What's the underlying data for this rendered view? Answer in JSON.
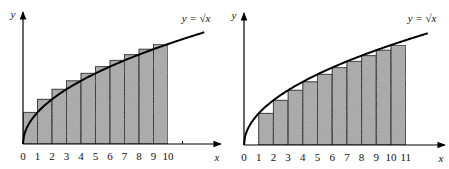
{
  "colors": {
    "bar_fill": "#a9a9a9",
    "bar_stroke": "#111111",
    "curve": "#000000",
    "axis": "#000000"
  },
  "chart_data": [
    {
      "type": "bar",
      "subtype": "riemann-sum-right-endpoint-overestimate",
      "title": "",
      "function_label": "y = √x",
      "xlabel": "x",
      "ylabel": "y",
      "x_ticks": [
        "0",
        "1",
        "2",
        "3",
        "4",
        "5",
        "6",
        "7",
        "8",
        "9",
        "10"
      ],
      "bars": [
        {
          "x0": 0,
          "x1": 1,
          "height": 1.0
        },
        {
          "x0": 1,
          "x1": 2,
          "height": 1.414
        },
        {
          "x0": 2,
          "x1": 3,
          "height": 1.732
        },
        {
          "x0": 3,
          "x1": 4,
          "height": 2.0
        },
        {
          "x0": 4,
          "x1": 5,
          "height": 2.236
        },
        {
          "x0": 5,
          "x1": 6,
          "height": 2.449
        },
        {
          "x0": 6,
          "x1": 7,
          "height": 2.646
        },
        {
          "x0": 7,
          "x1": 8,
          "height": 2.828
        },
        {
          "x0": 8,
          "x1": 9,
          "height": 3.0
        },
        {
          "x0": 9,
          "x1": 10,
          "height": 3.162
        }
      ],
      "curve_x_range": [
        0,
        12.5
      ],
      "xlim": [
        0,
        13.6
      ],
      "ylim": [
        0,
        4.2
      ],
      "grid": false,
      "layout": {
        "origin_px": [
          23,
          144
        ],
        "px_per_x": 14.5,
        "px_per_y": 31.6,
        "x_axis_end_px": 221,
        "y_axis_top_px": 12,
        "label_pos": [
          196,
          22
        ],
        "extra_tick_x": 11
      }
    },
    {
      "type": "bar",
      "subtype": "riemann-sum-left-endpoint-underestimate",
      "title": "",
      "function_label": "y = √x",
      "xlabel": "x",
      "ylabel": "y",
      "x_ticks": [
        "0",
        "1",
        "2",
        "3",
        "4",
        "5",
        "6",
        "7",
        "8",
        "9",
        "10",
        "11"
      ],
      "bars": [
        {
          "x0": 1,
          "x1": 2,
          "height": 1.0
        },
        {
          "x0": 2,
          "x1": 3,
          "height": 1.414
        },
        {
          "x0": 3,
          "x1": 4,
          "height": 1.732
        },
        {
          "x0": 4,
          "x1": 5,
          "height": 2.0
        },
        {
          "x0": 5,
          "x1": 6,
          "height": 2.236
        },
        {
          "x0": 6,
          "x1": 7,
          "height": 2.449
        },
        {
          "x0": 7,
          "x1": 8,
          "height": 2.646
        },
        {
          "x0": 8,
          "x1": 9,
          "height": 2.828
        },
        {
          "x0": 9,
          "x1": 10,
          "height": 3.0
        },
        {
          "x0": 10,
          "x1": 11,
          "height": 3.162
        }
      ],
      "curve_x_range": [
        0,
        12.5
      ],
      "xlim": [
        0,
        13.7
      ],
      "ylim": [
        0,
        4.2
      ],
      "grid": false,
      "layout": {
        "origin_px": [
          244,
          145
        ],
        "px_per_x": 14.7,
        "px_per_y": 31.6,
        "x_axis_end_px": 445,
        "y_axis_top_px": 13,
        "label_pos": [
          422,
          22
        ],
        "extra_tick_x": null
      }
    }
  ]
}
